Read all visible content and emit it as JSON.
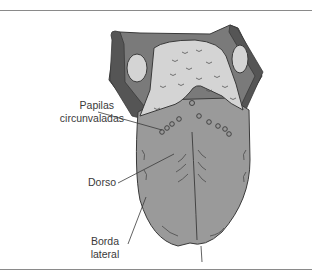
{
  "diagram": {
    "colors": {
      "tongue_body": "#9a9a9a",
      "root_region": "#d4d4d4",
      "dark_edges": "#5a5a5a",
      "outline": "#3a3a3a",
      "rule": "#8a8a8a",
      "label_text": "#3a3a3a"
    },
    "labels": [
      {
        "id": "papilas",
        "line1": "Papilas",
        "line2": "circunvaladas"
      },
      {
        "id": "dorso",
        "line1": "Dorso"
      },
      {
        "id": "borda",
        "line1": "Borda",
        "line2": "lateral"
      }
    ]
  }
}
